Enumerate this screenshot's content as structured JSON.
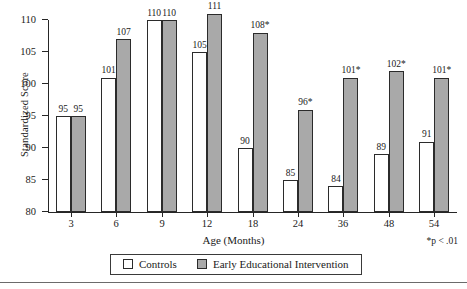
{
  "chart_data": {
    "type": "bar",
    "title": "",
    "xlabel": "Age (Months)",
    "ylabel": "Standardized Score",
    "categories": [
      "3",
      "6",
      "9",
      "12",
      "18",
      "24",
      "36",
      "48",
      "54"
    ],
    "ylim": [
      80,
      110
    ],
    "yticks": [
      80,
      85,
      90,
      95,
      100,
      105,
      110
    ],
    "grid": false,
    "legend_position": "bottom",
    "series": [
      {
        "name": "Controls",
        "color": "#ffffff",
        "values": [
          95,
          101,
          110,
          105,
          90,
          85,
          84,
          89,
          91
        ],
        "labels": [
          "95",
          "101",
          "110",
          "105",
          "90",
          "85",
          "84",
          "89",
          "91"
        ]
      },
      {
        "name": "Early Educational Intervention",
        "color": "#a9a9a9",
        "values": [
          95,
          107,
          110,
          111,
          108,
          96,
          101,
          102,
          101
        ],
        "labels": [
          "95",
          "107",
          "110",
          "111",
          "108*",
          "96*",
          "101*",
          "102*",
          "101*"
        ]
      }
    ],
    "annotations": [
      "*p < .01"
    ]
  },
  "legend": {
    "items": [
      {
        "label": "Controls",
        "swatch": "white-square"
      },
      {
        "label": "Early Educational Intervention",
        "swatch": "gray-square"
      }
    ]
  },
  "footnote": "*p < .01"
}
